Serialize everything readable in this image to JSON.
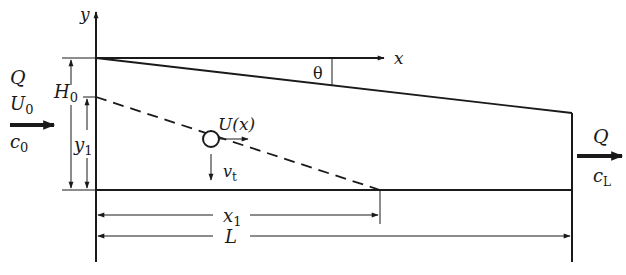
{
  "diagram": {
    "type": "settling-basin-schematic",
    "colors": {
      "stroke": "#1a1a1a",
      "background": "#ffffff"
    },
    "labels": {
      "y_axis": "y",
      "x_axis": "x",
      "theta": "θ",
      "inlet_flow": "Q",
      "inlet_velocity_base": "U",
      "inlet_velocity_sub": "0",
      "inlet_conc_base": "c",
      "inlet_conc_sub": "0",
      "depth_base": "H",
      "depth_sub": "0",
      "particle_height_base": "y",
      "particle_height_sub": "1",
      "particle_velocity": "U(x)",
      "settling_velocity_base": "v",
      "settling_velocity_sub": "t",
      "outlet_flow": "Q",
      "outlet_conc_base": "c",
      "outlet_conc_sub": "L",
      "x1_base": "x",
      "x1_sub": "1",
      "length": "L"
    }
  }
}
